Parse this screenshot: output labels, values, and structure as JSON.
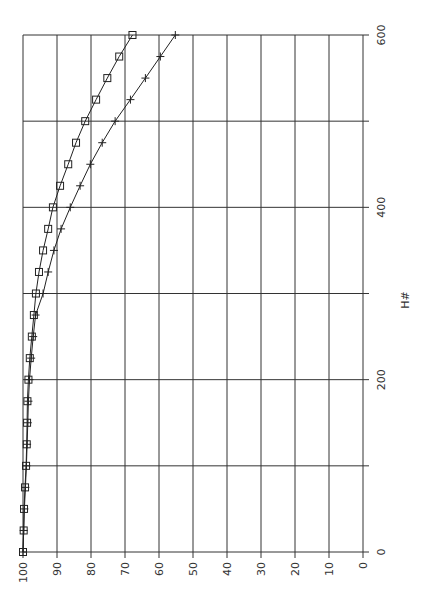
{
  "chart_data": {
    "type": "line",
    "title": "",
    "orientation": "rotated-90-ccw",
    "xlabel": "H#",
    "ylabel": "",
    "xlim": [
      0,
      600
    ],
    "ylim": [
      0,
      100
    ],
    "x_ticks": [
      0,
      200,
      400,
      600
    ],
    "x_minor_grid": [
      100,
      300,
      500
    ],
    "y_ticks": [
      0,
      10,
      20,
      30,
      40,
      50,
      60,
      70,
      80,
      90,
      100
    ],
    "grid": true,
    "legend": null,
    "x": [
      0,
      25,
      50,
      75,
      100,
      125,
      150,
      175,
      200,
      225,
      250,
      275,
      300,
      325,
      350,
      375,
      400,
      425,
      450,
      475,
      500,
      525,
      550,
      575,
      600
    ],
    "series": [
      {
        "name": "series-square",
        "marker": "square",
        "values": [
          100,
          99.8,
          99.7,
          99.4,
          99.1,
          98.9,
          98.8,
          98.7,
          98.4,
          98.0,
          97.4,
          96.8,
          96.2,
          95.3,
          94.1,
          92.6,
          91.2,
          89.1,
          86.7,
          84.4,
          81.7,
          78.5,
          75.2,
          71.7,
          67.8
        ]
      },
      {
        "name": "series-cross",
        "marker": "plus",
        "values": [
          100,
          99.8,
          99.6,
          99.3,
          99.0,
          98.8,
          98.6,
          98.4,
          98.1,
          97.6,
          97.0,
          96.3,
          94.1,
          92.6,
          90.9,
          88.8,
          86.1,
          83.2,
          80.2,
          76.7,
          72.9,
          68.4,
          64.0,
          59.6,
          55.2
        ]
      }
    ]
  },
  "colors": {
    "grid": "#333333",
    "line": "#222222",
    "text": "#333333",
    "background": "#ffffff"
  }
}
